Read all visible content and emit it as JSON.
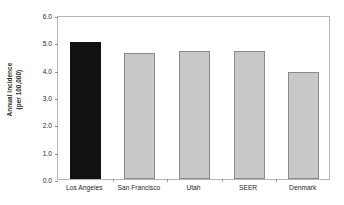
{
  "chart_data": {
    "type": "bar",
    "title": "",
    "subtitle": "",
    "xlabel": "",
    "ylabel": "Annual incidence (per 100,000)",
    "ylabel_lines": [
      "Annual incidence",
      "(per 100,000)"
    ],
    "categories": [
      "Los Angeles",
      "San Francisco",
      "Utah",
      "SEER",
      "Denmark"
    ],
    "values": [
      5.0,
      4.6,
      4.7,
      4.7,
      3.9
    ],
    "bar_colors": [
      "#111111",
      "#c8c8c8",
      "#c8c8c8",
      "#c8c8c8",
      "#c8c8c8"
    ],
    "bar_border_color": "#8a8a8a",
    "ylim": [
      0.0,
      6.0
    ],
    "ytick_values": [
      0.0,
      1.0,
      2.0,
      3.0,
      4.0,
      5.0,
      6.0
    ],
    "ytick_labels": [
      "0.0",
      "1.0",
      "2.0",
      "3.0",
      "4.0",
      "5.0",
      "6.0"
    ],
    "grid": false,
    "legend": null,
    "frame_color": "#b5b5b5",
    "background": "#ffffff",
    "annotations": []
  }
}
